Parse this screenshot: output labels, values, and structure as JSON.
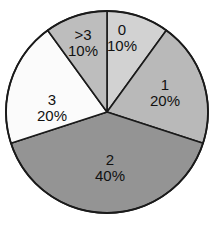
{
  "chart_data": {
    "type": "pie",
    "title": "",
    "subtitle": "",
    "xlabel": "",
    "ylabel": "",
    "legend_position": "none",
    "grid": false,
    "start_angle_deg": 0,
    "direction": "clockwise",
    "categories": [
      "0",
      "1",
      "2",
      "3",
      ">3"
    ],
    "values": [
      10,
      20,
      40,
      20,
      10
    ],
    "value_unit": "%",
    "labels": [
      "10%",
      "20%",
      "40%",
      "20%",
      "10%"
    ],
    "colors": [
      "#d2d2d2",
      "#b9b9b9",
      "#949494",
      "#fbfbfb",
      "#bdbdbd"
    ],
    "outline_color": "#1a1a1a",
    "background_color": "#ffffff",
    "text_color": "#111111",
    "slices": [
      {
        "name": "0",
        "percent_label": "10%",
        "value": 10,
        "color": "#d2d2d2",
        "start_deg": 0,
        "end_deg": 36,
        "label_x": 122,
        "label_y": 37
      },
      {
        "name": "1",
        "percent_label": "20%",
        "value": 20,
        "color": "#b9b9b9",
        "start_deg": 36,
        "end_deg": 108,
        "label_x": 165,
        "label_y": 92
      },
      {
        "name": "2",
        "percent_label": "40%",
        "value": 40,
        "color": "#949494",
        "start_deg": 108,
        "end_deg": 252,
        "label_x": 110,
        "label_y": 167
      },
      {
        "name": "3",
        "percent_label": "20%",
        "value": 20,
        "color": "#fbfbfb",
        "start_deg": 252,
        "end_deg": 324,
        "label_x": 52,
        "label_y": 107
      },
      {
        "name": ">3",
        "percent_label": "10%",
        "value": 10,
        "color": "#bdbdbd",
        "start_deg": 324,
        "end_deg": 360,
        "label_x": 83,
        "label_y": 42
      }
    ],
    "geometry": {
      "center_x": 107,
      "center_y": 112,
      "radius": 101
    }
  }
}
